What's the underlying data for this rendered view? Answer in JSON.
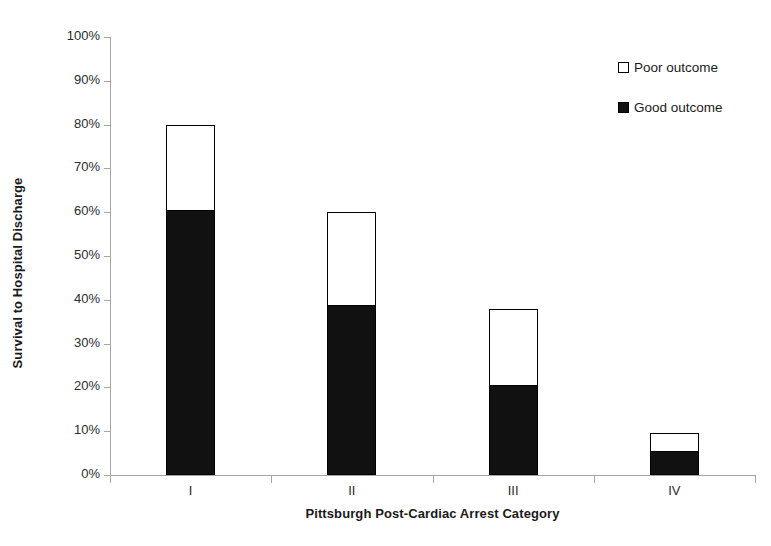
{
  "chart_data": {
    "type": "bar",
    "subtype": "stacked-vertical",
    "title": "",
    "xlabel": "Pittsburgh Post-Cardiac Arrest Category",
    "ylabel": "Survival to Hospital Discharge",
    "categories": [
      "I",
      "II",
      "III",
      "IV"
    ],
    "series": [
      {
        "name": "Good outcome",
        "color": "#111111",
        "values": [
          60.3,
          38.6,
          20.3,
          5.2
        ]
      },
      {
        "name": "Poor outcome",
        "color": "#ffffff",
        "values": [
          19.7,
          21.4,
          17.7,
          4.3
        ]
      }
    ],
    "totals": [
      80.0,
      60.0,
      38.0,
      9.5
    ],
    "ylim": [
      0,
      100
    ],
    "ytick_values": [
      0,
      10,
      20,
      30,
      40,
      50,
      60,
      70,
      80,
      90,
      100
    ],
    "ytick_labels": [
      "0%",
      "10%",
      "20%",
      "30%",
      "40%",
      "50%",
      "60%",
      "70%",
      "80%",
      "90%",
      "100%"
    ],
    "yunit": "%",
    "grid": false,
    "legend_position": "top-right",
    "legend_entries": [
      "Poor outcome",
      "Good outcome"
    ]
  },
  "legend": {
    "entries": [
      {
        "label": "Poor outcome",
        "swatch": "hollow-square-icon",
        "fill": "#ffffff"
      },
      {
        "label": "Good outcome",
        "swatch": "filled-square-icon",
        "fill": "#111111"
      }
    ]
  },
  "axes": {
    "y_title": "Survival to Hospital Discharge",
    "x_title": "Pittsburgh Post-Cardiac Arrest Category"
  }
}
